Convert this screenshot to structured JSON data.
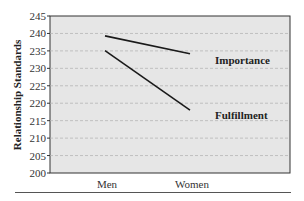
{
  "chart_data": {
    "type": "line",
    "title": "",
    "xlabel": "",
    "ylabel": "Relationship Standards",
    "categories": [
      "Men",
      "Women"
    ],
    "series": [
      {
        "name": "Importance",
        "values": [
          239.3,
          234.2
        ]
      },
      {
        "name": "Fulfillment",
        "values": [
          235.1,
          218.0
        ]
      }
    ],
    "ylim": [
      200,
      245
    ],
    "yticks": [
      200,
      205,
      210,
      215,
      220,
      225,
      230,
      235,
      240,
      245
    ],
    "grid": "horizontal dashed",
    "legend": "inline labels at right of lines",
    "annotations": [
      "Importance",
      "Fulfillment"
    ]
  },
  "colors": {
    "plot_background": "#e6e6e6",
    "line": "#1a1a1a",
    "grid": "#b5b5b5",
    "axis": "#333333"
  }
}
